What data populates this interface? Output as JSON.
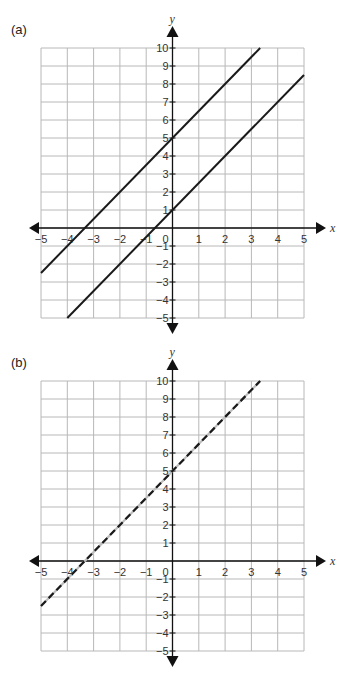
{
  "chart_data": [
    {
      "panel": "(a)",
      "type": "line",
      "title": "",
      "xlabel": "x",
      "ylabel": "y",
      "xlim": [
        -5,
        5
      ],
      "ylim": [
        -5,
        10
      ],
      "grid": true,
      "x_ticks": [
        -5,
        -4,
        -3,
        -2,
        -1,
        0,
        1,
        2,
        3,
        4,
        5
      ],
      "y_ticks": [
        -5,
        -4,
        -3,
        -2,
        -1,
        1,
        2,
        3,
        4,
        5,
        6,
        7,
        8,
        9,
        10
      ],
      "series": [
        {
          "name": "line 1",
          "equation": "y = 1.5x + 5",
          "style": "solid",
          "points": [
            [
              -5,
              -2.5
            ],
            [
              3.333,
              10
            ]
          ]
        },
        {
          "name": "line 2",
          "equation": "y = 1.5x + 1",
          "style": "solid",
          "points": [
            [
              -4,
              -5
            ],
            [
              5,
              8.5
            ]
          ]
        }
      ]
    },
    {
      "panel": "(b)",
      "type": "line",
      "title": "",
      "xlabel": "x",
      "ylabel": "y",
      "xlim": [
        -5,
        5
      ],
      "ylim": [
        -5,
        10
      ],
      "grid": true,
      "x_ticks": [
        -5,
        -4,
        -3,
        -2,
        -1,
        0,
        1,
        2,
        3,
        4,
        5
      ],
      "y_ticks": [
        -5,
        -4,
        -3,
        -2,
        -1,
        1,
        2,
        3,
        4,
        5,
        6,
        7,
        8,
        9,
        10
      ],
      "series": [
        {
          "name": "line 1",
          "equation": "y = 1.5x + 5",
          "style": "dashed",
          "points": [
            [
              -5,
              -2.5
            ],
            [
              3.333,
              10
            ]
          ]
        }
      ]
    }
  ],
  "panels": {
    "a": {
      "label": "(a)",
      "top": 48
    },
    "b": {
      "label": "(b)",
      "top": 381
    }
  }
}
